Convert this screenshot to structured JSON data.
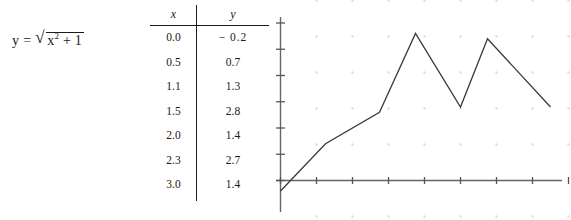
{
  "equation": {
    "lhs": "y",
    "operator": "=",
    "radicand_base": "x",
    "radicand_exponent": "2",
    "radicand_tail": "+ 1",
    "full_text": "y = √(x² + 1)",
    "radical_symbol": "√"
  },
  "table": {
    "headers": [
      "x",
      "y"
    ],
    "rows": [
      {
        "x": "0.0",
        "y": "− 0.2"
      },
      {
        "x": "0.5",
        "y": "0.7"
      },
      {
        "x": "1.1",
        "y": "1.3"
      },
      {
        "x": "1.5",
        "y": "2.8"
      },
      {
        "x": "2.0",
        "y": "1.4"
      },
      {
        "x": "2.3",
        "y": "2.7"
      },
      {
        "x": "3.0",
        "y": "1.4"
      }
    ]
  },
  "chart_data": {
    "type": "line",
    "title": "",
    "xlabel": "",
    "ylabel": "",
    "x": [
      0.0,
      0.5,
      1.1,
      1.5,
      2.0,
      2.3,
      3.0
    ],
    "values": [
      -0.2,
      0.7,
      1.3,
      2.8,
      1.4,
      2.7,
      1.4
    ],
    "series": [
      {
        "name": "y",
        "values": [
          -0.2,
          0.7,
          1.3,
          2.8,
          1.4,
          2.7,
          1.4
        ]
      }
    ],
    "xlim": [
      0.0,
      3.2
    ],
    "ylim": [
      -0.4,
      3.2
    ],
    "x_ticks": [
      0.0,
      0.4,
      0.8,
      1.2,
      1.6,
      2.0,
      2.4,
      2.8,
      3.2
    ],
    "y_ticks": [
      0.0,
      0.5,
      1.0,
      1.5,
      2.0,
      2.5,
      3.0
    ],
    "grid": "dotted-points",
    "legend": "none",
    "axis_color": "#555555",
    "line_color": "#3a3a3a",
    "grid_color": "#c8c8c8"
  }
}
